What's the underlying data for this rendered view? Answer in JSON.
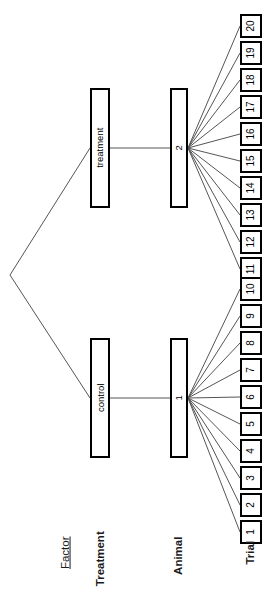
{
  "diagram": {
    "title": "Factor",
    "orientation": "rotated-90",
    "columns": [
      {
        "key": "factor",
        "label": "Factor",
        "style": "underline"
      },
      {
        "key": "treatment",
        "label": "Treatment",
        "style": "bold"
      },
      {
        "key": "animal",
        "label": "Animal",
        "style": "bold"
      },
      {
        "key": "trial",
        "label": "Trial",
        "style": "bold"
      }
    ],
    "root": {
      "label": ""
    },
    "treatments": [
      {
        "id": "treatment",
        "label": "treatment"
      },
      {
        "id": "control",
        "label": "control"
      }
    ],
    "animals": [
      {
        "id": "animal-2",
        "label": "2",
        "treatment": "treatment"
      },
      {
        "id": "animal-1",
        "label": "1",
        "treatment": "control"
      }
    ],
    "trials_upper": [
      "20",
      "19",
      "18",
      "17",
      "16",
      "15",
      "14",
      "13",
      "12",
      "11"
    ],
    "trials_lower": [
      "10",
      "9",
      "8",
      "7",
      "6",
      "5",
      "4",
      "3",
      "2",
      "1"
    ],
    "colors": {
      "line": "#555555",
      "border": "#000000",
      "background": "#ffffff",
      "text": "#000000",
      "label_text": "#1b1b1b"
    }
  }
}
